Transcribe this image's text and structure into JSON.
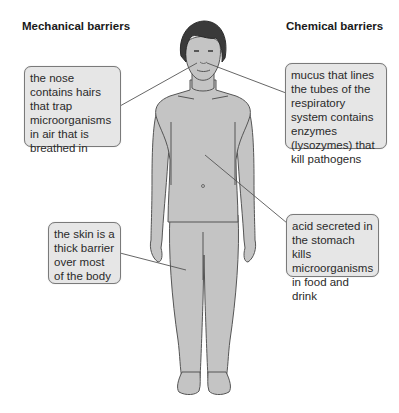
{
  "titles": {
    "mechanical": "Mechanical barriers",
    "chemical": "Chemical barriers"
  },
  "labels": {
    "nose": "the nose contains hairs that trap microorganisms in air that is breathed in",
    "skin": "the skin is a thick barrier over most of the body",
    "mucus": "mucus that lines the tubes of the respiratory system contains enzymes (lysozymes) that kill pathogens",
    "acid": "acid secreted in the stomach kills microorganisms in food and drink"
  },
  "colors": {
    "body_fill": "#c4c4c4",
    "outline": "#555555",
    "hair": "#3a3a3a",
    "box_fill": "#e6e6e6"
  }
}
